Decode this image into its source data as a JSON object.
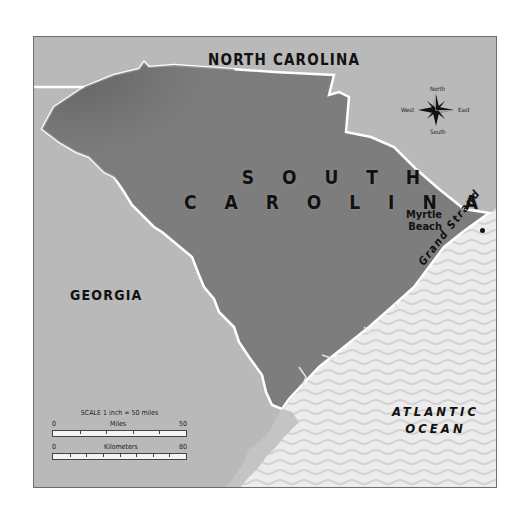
{
  "map": {
    "title": "South Carolina",
    "colors": {
      "land_neighbor": "#b9b9b9",
      "land_state": "#7d7d7d",
      "state_dark_upstate": "#646464",
      "ocean": "#e9e9e9",
      "ocean_wave": "#d6d6d6",
      "border": "#ffffff",
      "frame": "#6d6d6d",
      "text": "#111111"
    },
    "labels": {
      "north_carolina": "NORTH CAROLINA",
      "georgia": "GEORGIA",
      "south_carolina_line1": "S O U T H",
      "south_carolina_line2": "C A R O L I N A",
      "city_line1": "Myrtle",
      "city_line2": "Beach",
      "coast_region": "Grand Strand",
      "ocean_line1": "ATLANTIC",
      "ocean_line2": "OCEAN"
    },
    "compass": {
      "north": "North",
      "south": "South",
      "east": "East",
      "west": "West"
    },
    "scale": {
      "title": "SCALE 1 inch = 50 miles",
      "miles": {
        "label": "Miles",
        "min": "0",
        "max": "50"
      },
      "kilometers": {
        "label": "Kilometers",
        "min": "0",
        "max": "80"
      }
    }
  }
}
